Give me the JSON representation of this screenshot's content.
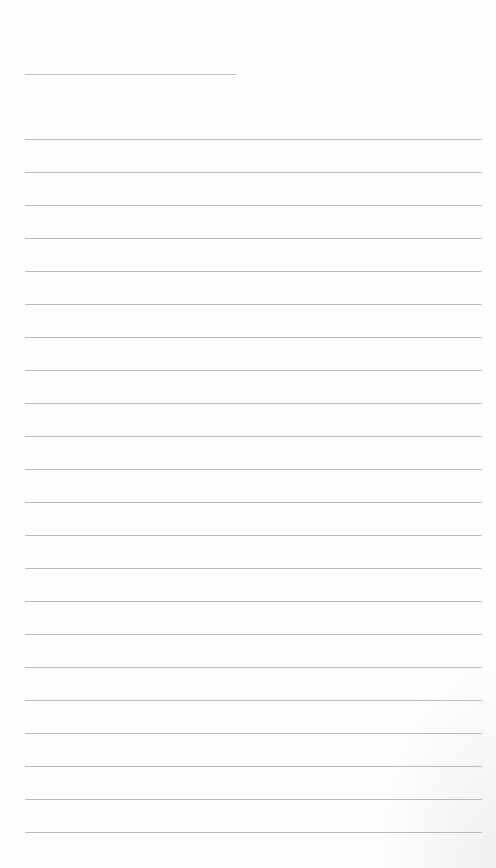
{
  "page": {
    "type": "lined-notepaper",
    "background_color": "#ffffff",
    "line_color": "#b9b9b9",
    "title_line": {
      "x": 25,
      "y": 74,
      "width": 211
    },
    "ruled_lines": {
      "x": 25,
      "width": 457,
      "start_y": 139,
      "spacing": 33,
      "count": 22
    }
  }
}
